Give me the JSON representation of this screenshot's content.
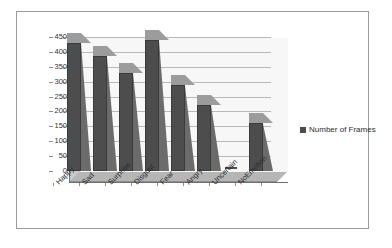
{
  "chart_data": {
    "type": "bar",
    "title": "",
    "xlabel": "",
    "ylabel": "",
    "categories": [
      "Happy",
      "Sad",
      "Surprise",
      "Disgust",
      "Fear",
      "Angry",
      "Uncertain",
      "NoEmotion"
    ],
    "series": [
      {
        "name": "Number of Frames",
        "values": [
          430,
          385,
          330,
          440,
          288,
          222,
          0,
          160
        ]
      }
    ],
    "values": [
      430,
      385,
      330,
      440,
      288,
      222,
      0,
      160
    ],
    "ylim": [
      0,
      450
    ],
    "yticks": [
      0,
      50,
      100,
      150,
      200,
      250,
      300,
      350,
      400,
      450
    ],
    "ytick_labels": [
      "0",
      "50",
      "100",
      "150",
      "200",
      "250",
      "300",
      "350",
      "400",
      "450"
    ],
    "grid": true,
    "grid_axis": "y",
    "legend": {
      "position": "right",
      "entries": [
        {
          "label": "Number of Frames",
          "color": "#4d4d4d",
          "marker": "square"
        }
      ]
    },
    "style": {
      "three_d": true,
      "bar_color": "#4d4d4d",
      "plot_background": "#f7f7f7",
      "gridline_color": "#b9b9b9",
      "floor_color": "#b6b6b6",
      "frame_color": "#9a9a9a"
    }
  }
}
